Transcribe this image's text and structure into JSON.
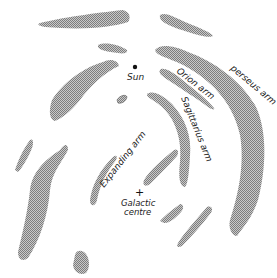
{
  "diagram": {
    "title": "",
    "labels": {
      "sun": "Sun",
      "orion_arm": "Orion arm",
      "perseus_arm": "perseus arm",
      "sagittarius_arm": "Sagittarius arm",
      "expanding_arm": "Expanding arm",
      "galactic_centre_line1": "Galactic",
      "galactic_centre_line2": "centre"
    },
    "markers": {
      "sun": "dot",
      "galactic_centre": "+"
    },
    "colors": {
      "arm_fill": "#b8b8b8",
      "arm_stipple": "#8a8a8a",
      "text": "#222222",
      "background": "#ffffff"
    }
  }
}
